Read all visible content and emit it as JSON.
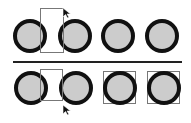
{
  "diagram": {
    "colors": {
      "circle_fill": "#cccccc",
      "circle_stroke": "#111111",
      "selection_rect": "#777777",
      "divider": "#222222"
    },
    "top_row": {
      "circles": 4,
      "selected": [],
      "cursor": "arrow-pointer"
    },
    "bottom_row": {
      "circles": 4,
      "selected": [
        3,
        4
      ],
      "cursor": "arrow-pointer"
    }
  }
}
